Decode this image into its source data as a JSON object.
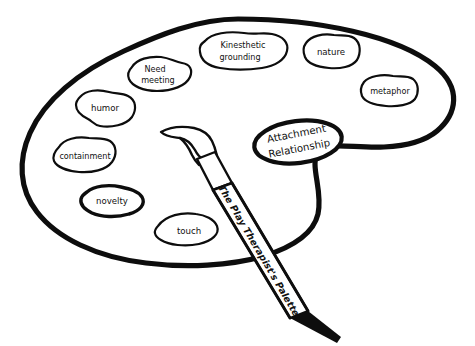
{
  "figure": {
    "title_label": "The Play Therapist's Palette",
    "kind": "line-drawing-diagram",
    "colors": {
      "ink": "#0d0d0d",
      "paper": "#ffffff",
      "text": "#111111"
    }
  },
  "palette": {
    "name": "artist-palette",
    "wells": [
      {
        "id": "kinesthetic-grounding",
        "label_line1": "Kinesthetic",
        "label_line2": "grounding",
        "emphasis": "normal"
      },
      {
        "id": "nature",
        "label": "nature",
        "emphasis": "normal"
      },
      {
        "id": "need-meeting",
        "label_line1": "Need",
        "label_line2": "meeting",
        "emphasis": "normal"
      },
      {
        "id": "metaphor",
        "label": "metaphor",
        "emphasis": "normal"
      },
      {
        "id": "humor",
        "label": "humor",
        "emphasis": "normal"
      },
      {
        "id": "containment",
        "label": "containment",
        "emphasis": "normal"
      },
      {
        "id": "novelty",
        "label": "novelty",
        "emphasis": "bold"
      },
      {
        "id": "touch",
        "label": "touch",
        "emphasis": "normal"
      },
      {
        "id": "attachment-relationship",
        "label_line1": "Attachment",
        "label_line2": "Relationship",
        "emphasis": "bold"
      }
    ]
  },
  "brush": {
    "name": "paintbrush",
    "handle_label": "The Play Therapist's Palette"
  }
}
